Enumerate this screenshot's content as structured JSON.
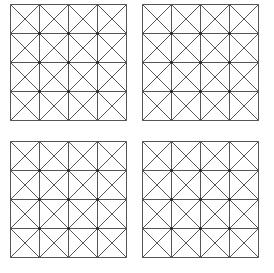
{
  "diagram": {
    "line_color": "#555555",
    "node_color": "#222222",
    "background": "#ffffff",
    "rows": 4,
    "cols": 4,
    "cell_size": 29,
    "diagonals_per_cell": 2,
    "grids": [
      {
        "id": "top-left",
        "x": 10,
        "y": 4
      },
      {
        "id": "top-right",
        "x": 142,
        "y": 4
      },
      {
        "id": "bottom-left",
        "x": 10,
        "y": 141
      },
      {
        "id": "bottom-right",
        "x": 142,
        "y": 141
      }
    ]
  }
}
